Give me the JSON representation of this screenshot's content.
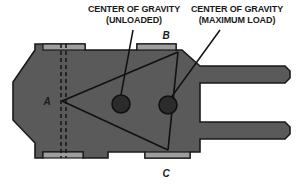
{
  "diagram": {
    "colors": {
      "body_fill": "#5a5a5a",
      "pad_fill": "#9e9e9e",
      "outline": "#1a1a1a",
      "cg_marker": "#2b2b2b",
      "background": "#ffffff"
    },
    "annotations": [
      {
        "id": "cg-unloaded",
        "line1": "CENTER OF GRAVITY",
        "line2": "(UNLOADED)",
        "text_x": 134,
        "text_y": 12,
        "leader": {
          "x1": 133,
          "y1": 30,
          "x2": 121,
          "y2": 95
        }
      },
      {
        "id": "cg-maximum-load",
        "line1": "CENTER OF GRAVITY",
        "line2": "(MAXIMUM LOAD)",
        "text_x": 237,
        "text_y": 12,
        "leader": {
          "x1": 220,
          "y1": 30,
          "x2": 170,
          "y2": 99
        }
      }
    ],
    "points": [
      {
        "label": "A",
        "x": 47,
        "y": 105,
        "node_x": 62,
        "node_y": 101
      },
      {
        "label": "B",
        "x": 166,
        "y": 39,
        "node_x": 178,
        "node_y": 52
      },
      {
        "label": "C",
        "x": 166,
        "y": 177,
        "node_x": 168,
        "node_y": 150
      }
    ],
    "cg_markers": [
      {
        "id": "cg-unloaded-marker",
        "cx": 121,
        "cy": 104,
        "r": 9
      },
      {
        "id": "cg-max-load-marker",
        "cx": 168,
        "cy": 105,
        "r": 9
      }
    ],
    "stability_triangle": {
      "vertices": "62,101 178,52 168,150",
      "edges": [
        "A-B",
        "B-C",
        "C-A"
      ]
    },
    "mast_dashed_lines": [
      {
        "x": 61,
        "y1": 44,
        "y2": 158
      },
      {
        "x": 66,
        "y1": 44,
        "y2": 158
      }
    ],
    "body_outline": "35,50 35,44 85,44 85,50 137,50 137,44 176,44 176,50 182,50 200,66 285,66 290,71 290,78 285,83 200,83 200,122 285,122 290,127 290,134 285,139 200,139 200,152 190,152 190,158 145,158 145,152 108,152 108,158 83,158 83,152 43,152 43,158 35,158 35,143 13,120 13,82",
    "top_pads": [
      {
        "x": 43,
        "y": 44,
        "w": 42,
        "h": 6
      },
      {
        "x": 137,
        "y": 44,
        "w": 39,
        "h": 6
      }
    ],
    "bottom_pads": [
      {
        "x": 43,
        "y": 152,
        "w": 40,
        "h": 6
      },
      {
        "x": 145,
        "y": 152,
        "w": 45,
        "h": 6
      }
    ]
  }
}
